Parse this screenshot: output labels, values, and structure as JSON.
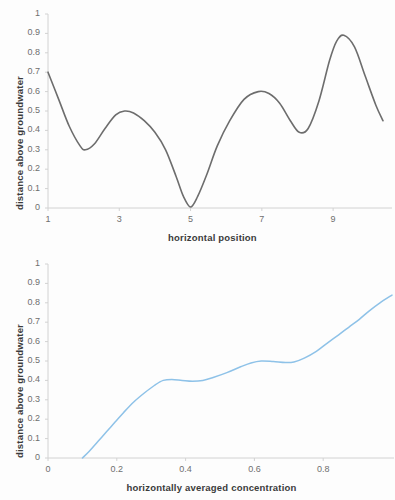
{
  "figure": {
    "background_color": "#fdfdfd",
    "panels": 2
  },
  "chart_data": [
    {
      "type": "line",
      "title": "",
      "xlabel": "horizontal position",
      "ylabel": "distance above groundwater",
      "xlim": [
        1,
        10.4
      ],
      "ylim": [
        0,
        1
      ],
      "xticks": [
        "1",
        "3",
        "5",
        "7",
        "9"
      ],
      "xtick_values": [
        1,
        3,
        5,
        7,
        9
      ],
      "yticks": [
        "0",
        "0.1",
        "0.2",
        "0.3",
        "0.4",
        "0.5",
        "0.6",
        "0.7",
        "0.8",
        "0.9",
        "1"
      ],
      "ytick_values": [
        0,
        0.1,
        0.2,
        0.3,
        0.4,
        0.5,
        0.6,
        0.7,
        0.8,
        0.9,
        1
      ],
      "grid": false,
      "legend": "none",
      "line_color": "#6d6d6d",
      "line_width": 1.6,
      "x": [
        1.0,
        1.3,
        1.6,
        1.9,
        2.05,
        2.3,
        2.6,
        2.9,
        3.15,
        3.4,
        3.7,
        4.0,
        4.3,
        4.6,
        4.8,
        5.0,
        5.2,
        5.45,
        5.75,
        6.1,
        6.5,
        6.9,
        7.2,
        7.5,
        7.8,
        8.05,
        8.3,
        8.6,
        8.9,
        9.1,
        9.3,
        9.6,
        9.9,
        10.2,
        10.4
      ],
      "y": [
        0.7,
        0.56,
        0.42,
        0.32,
        0.3,
        0.33,
        0.41,
        0.48,
        0.5,
        0.49,
        0.45,
        0.39,
        0.3,
        0.16,
        0.06,
        0.005,
        0.06,
        0.17,
        0.32,
        0.45,
        0.56,
        0.6,
        0.59,
        0.54,
        0.45,
        0.39,
        0.41,
        0.55,
        0.76,
        0.86,
        0.89,
        0.83,
        0.68,
        0.53,
        0.45
      ]
    },
    {
      "type": "line",
      "title": "",
      "xlabel": "horizontally averaged concentration",
      "ylabel": "distance above groundwater",
      "xlim": [
        0,
        1.0
      ],
      "ylim": [
        0,
        1
      ],
      "xticks": [
        "0",
        "0.2",
        "0.4",
        "0.6",
        "0.8"
      ],
      "xtick_values": [
        0,
        0.2,
        0.4,
        0.6,
        0.8
      ],
      "yticks": [
        "0",
        "0.1",
        "0.2",
        "0.3",
        "0.4",
        "0.5",
        "0.6",
        "0.7",
        "0.8",
        "0.9",
        "1"
      ],
      "ytick_values": [
        0,
        0.1,
        0.2,
        0.3,
        0.4,
        0.5,
        0.6,
        0.7,
        0.8,
        0.9,
        1
      ],
      "grid": false,
      "legend": "none",
      "line_color": "#8ec2e8",
      "line_width": 1.5,
      "x": [
        0.1,
        0.12,
        0.145,
        0.17,
        0.195,
        0.22,
        0.25,
        0.28,
        0.31,
        0.335,
        0.36,
        0.39,
        0.42,
        0.45,
        0.48,
        0.52,
        0.56,
        0.59,
        0.62,
        0.655,
        0.69,
        0.715,
        0.745,
        0.78,
        0.81,
        0.845,
        0.875,
        0.905,
        0.935,
        0.965,
        1.0
      ],
      "y": [
        0.0,
        0.035,
        0.085,
        0.135,
        0.185,
        0.235,
        0.29,
        0.335,
        0.375,
        0.4,
        0.405,
        0.4,
        0.396,
        0.4,
        0.415,
        0.44,
        0.47,
        0.49,
        0.5,
        0.497,
        0.492,
        0.495,
        0.515,
        0.55,
        0.59,
        0.635,
        0.675,
        0.715,
        0.76,
        0.8,
        0.84
      ]
    }
  ],
  "charts": [
    {
      "id": "chart-top",
      "x_axis_title": "horizontal position",
      "y_axis_title": "distance above groundwater"
    },
    {
      "id": "chart-bottom",
      "x_axis_title": "horizontally averaged concentration",
      "y_axis_title": "distance above groundwater"
    }
  ]
}
